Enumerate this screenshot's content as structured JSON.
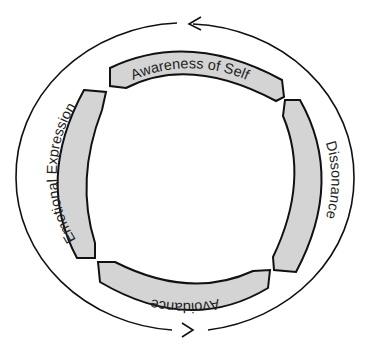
{
  "diagram": {
    "type": "cycle",
    "direction": "counterclockwise",
    "stages": [
      {
        "label": "Awareness of Self",
        "position": "top"
      },
      {
        "label": "Dissonance",
        "position": "right"
      },
      {
        "label": "Avoidance",
        "position": "bottom"
      },
      {
        "label": "Emotional Expression",
        "position": "left"
      }
    ],
    "arrows": [
      {
        "position": "top",
        "pointing": "left"
      },
      {
        "position": "bottom",
        "pointing": "right"
      }
    ],
    "colors": {
      "segment_fill": "#d4d4d4",
      "stroke": "#111111",
      "background": "#ffffff"
    }
  }
}
